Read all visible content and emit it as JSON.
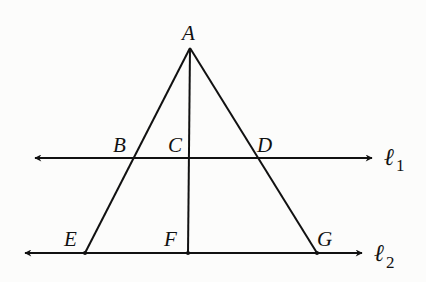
{
  "diagram": {
    "type": "geometry",
    "colors": {
      "line": "#111111",
      "background": "#fcfcfb"
    },
    "points": {
      "A": {
        "label": "A",
        "x": 190,
        "y": 48
      },
      "B": {
        "label": "B",
        "x": 133,
        "y": 158
      },
      "C": {
        "label": "C",
        "x": 189,
        "y": 158
      },
      "D": {
        "label": "D",
        "x": 258,
        "y": 158
      },
      "E": {
        "label": "E",
        "x": 85,
        "y": 253
      },
      "F": {
        "label": "F",
        "x": 188,
        "y": 253
      },
      "G": {
        "label": "G",
        "x": 317,
        "y": 253
      }
    },
    "lines": {
      "l1": {
        "label": "ℓ",
        "subscript": "1",
        "y": 158,
        "x1": 35,
        "x2": 372
      },
      "l2": {
        "label": "ℓ",
        "subscript": "2",
        "y": 253,
        "x1": 25,
        "x2": 362
      }
    },
    "segments": [
      "AE",
      "AF",
      "AG"
    ]
  }
}
